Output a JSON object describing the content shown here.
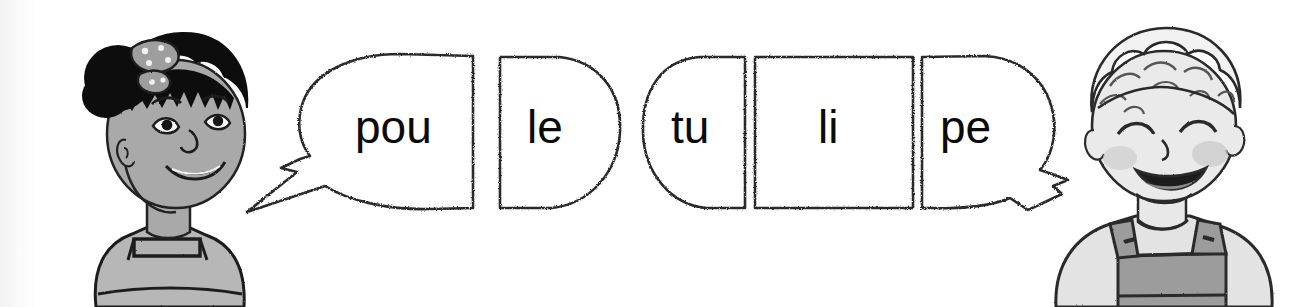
{
  "worksheet": {
    "title": "Syllable assembly exercise",
    "background_color": "#ffffff",
    "ink_color": "#1a1a1a",
    "text_color": "#0b0b0b"
  },
  "characters": [
    {
      "id": "girl",
      "name": "girl-character",
      "description": "Smiling girl with dark hair in a bun and a polka-dot hair bow, wearing a pinafore",
      "position": "left",
      "skin_color": "#a9a9a9",
      "hair_color": "#111111",
      "clothing_color": "#b5b5b5",
      "speaks": "poule"
    },
    {
      "id": "boy",
      "name": "boy-character",
      "description": "Smiling boy with light curly hair wearing overalls",
      "position": "right",
      "skin_color": "#e8e8e8",
      "hair_color": "#efefef",
      "clothing_color": "#9c9c9c",
      "speaks": "tulipe"
    }
  ],
  "bubbles": [
    {
      "id": "b1",
      "text": "pou",
      "shape": "speech-bubble-with-tail-left",
      "word": "poule",
      "order": 1
    },
    {
      "id": "b2",
      "text": "le",
      "shape": "half-round-right",
      "word": "poule",
      "order": 2
    },
    {
      "id": "b3",
      "text": "tu",
      "shape": "half-round-left",
      "word": "tulipe",
      "order": 1
    },
    {
      "id": "b4",
      "text": "li",
      "shape": "rectangle",
      "word": "tulipe",
      "order": 2
    },
    {
      "id": "b5",
      "text": "pe",
      "shape": "speech-bubble-with-tail-right",
      "word": "tulipe",
      "order": 3
    }
  ],
  "words": [
    {
      "word": "poule",
      "syllables": [
        "pou",
        "le"
      ]
    },
    {
      "word": "tulipe",
      "syllables": [
        "tu",
        "li",
        "pe"
      ]
    }
  ]
}
